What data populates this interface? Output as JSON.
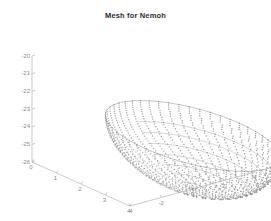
{
  "figure": {
    "title": "Mesh for Nemoh",
    "background_color": "#ffffff",
    "title_color": "#2b2b2b",
    "axis_color": "#a8a8a8",
    "tick_label_color": "#8a8a8a",
    "mesh_color": "#777777",
    "width": 271,
    "height": 221
  },
  "chart_data": {
    "type": "scatter",
    "title": "Mesh for Nemoh",
    "xlabel": "",
    "ylabel": "",
    "zlabel": "",
    "grid": false,
    "legend": null,
    "projection": "3d",
    "axes": {
      "x": {
        "label": "",
        "ticks": [
          4,
          3,
          2,
          1,
          0
        ],
        "lim": [
          0,
          4
        ],
        "screen_from": [
          32,
          162
        ],
        "screen_to": [
          130,
          206
        ]
      },
      "y": {
        "label": "",
        "ticks": [
          -4,
          -2,
          0,
          2,
          4
        ],
        "lim": [
          -4,
          4
        ],
        "screen_from": [
          130,
          206
        ],
        "screen_to": [
          255,
          172
        ]
      },
      "z": {
        "label": "",
        "ticks": [
          -20,
          -21,
          -22,
          -23,
          -24,
          -25,
          -26
        ],
        "lim": [
          -26,
          -20
        ],
        "screen_from": [
          32,
          56
        ],
        "screen_to": [
          32,
          162
        ]
      }
    },
    "z_tick_labels": [
      "-20",
      "-21",
      "-22",
      "-23",
      "-24",
      "-25",
      "-26"
    ],
    "x_tick_labels": [
      "4",
      "3",
      "2",
      "1",
      "0"
    ],
    "y_tick_labels": [
      "-4",
      "-2",
      "0",
      "2",
      "4"
    ],
    "geometry": {
      "shape": "hemisphere",
      "radius": 3.0,
      "center": [
        0,
        0,
        -23.0
      ],
      "n_theta": 40,
      "n_phi": 44,
      "marker": "point",
      "marker_size": 0.7
    }
  }
}
